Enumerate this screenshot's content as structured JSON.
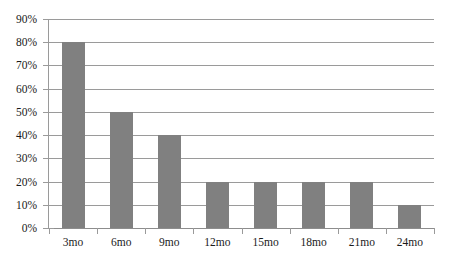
{
  "chart_data": {
    "type": "bar",
    "title": "",
    "subtitle": "",
    "xlabel": "",
    "ylabel": "",
    "categories": [
      "3mo",
      "6mo",
      "9mo",
      "12mo",
      "15mo",
      "18mo",
      "21mo",
      "24mo"
    ],
    "values": [
      80,
      50,
      40,
      20,
      20,
      20,
      20,
      10
    ],
    "value_unit": "%",
    "ylim": [
      0,
      90
    ],
    "ytick_step": 10,
    "ytick_labels": [
      "0%",
      "10%",
      "20%",
      "30%",
      "40%",
      "50%",
      "60%",
      "70%",
      "80%",
      "90%"
    ],
    "ytick_values": [
      0,
      10,
      20,
      30,
      40,
      50,
      60,
      70,
      80,
      90
    ],
    "series": [
      {
        "name": "",
        "values": [
          80,
          50,
          40,
          20,
          20,
          20,
          20,
          10
        ]
      }
    ],
    "grid": true,
    "grid_axis": "y",
    "legend": false,
    "legend_position": "none",
    "annotations": [],
    "colors": {
      "bar": "#808080",
      "gridline": "#9a9a9a",
      "axis": "#9a9a9a",
      "background": "#ffffff",
      "text": "#1a1a1a"
    }
  }
}
